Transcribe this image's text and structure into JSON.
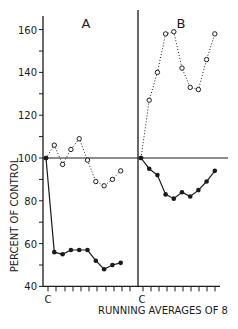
{
  "chart_data": {
    "type": "line",
    "title": "",
    "xlabel": "RUNNING AVERAGES OF 8",
    "ylabel": "PERCENT OF CONTROL",
    "ylim": [
      40,
      165
    ],
    "yticks": [
      40,
      60,
      80,
      100,
      120,
      140,
      160
    ],
    "grid": false,
    "reference_line": 100,
    "panels": [
      {
        "label": "A",
        "x_start_label": "C",
        "series": [
          {
            "name": "open circles (dotted)",
            "marker": "open-circle",
            "line": "dotted",
            "values": [
              100,
              106,
              97,
              104,
              109,
              99,
              89,
              87,
              90,
              94
            ]
          },
          {
            "name": "filled circles (solid)",
            "marker": "filled-circle",
            "line": "solid",
            "values": [
              100,
              56,
              55,
              57,
              57,
              57,
              52,
              48,
              50,
              51
            ]
          }
        ]
      },
      {
        "label": "B",
        "x_start_label": "C",
        "series": [
          {
            "name": "open circles (dotted)",
            "marker": "open-circle",
            "line": "dotted",
            "values": [
              100,
              127,
              140,
              158,
              159,
              142,
              133,
              132,
              146,
              158
            ]
          },
          {
            "name": "filled circles (solid)",
            "marker": "filled-circle",
            "line": "solid",
            "values": [
              100,
              95,
              92,
              83,
              81,
              84,
              82,
              85,
              89,
              94
            ]
          }
        ]
      }
    ]
  },
  "labels": {
    "panel_a": "A",
    "panel_b": "B",
    "ylabel": "PERCENT OF CONTROL",
    "xlabel": "RUNNING AVERAGES OF 8",
    "c_a": "C",
    "c_b": "C"
  }
}
